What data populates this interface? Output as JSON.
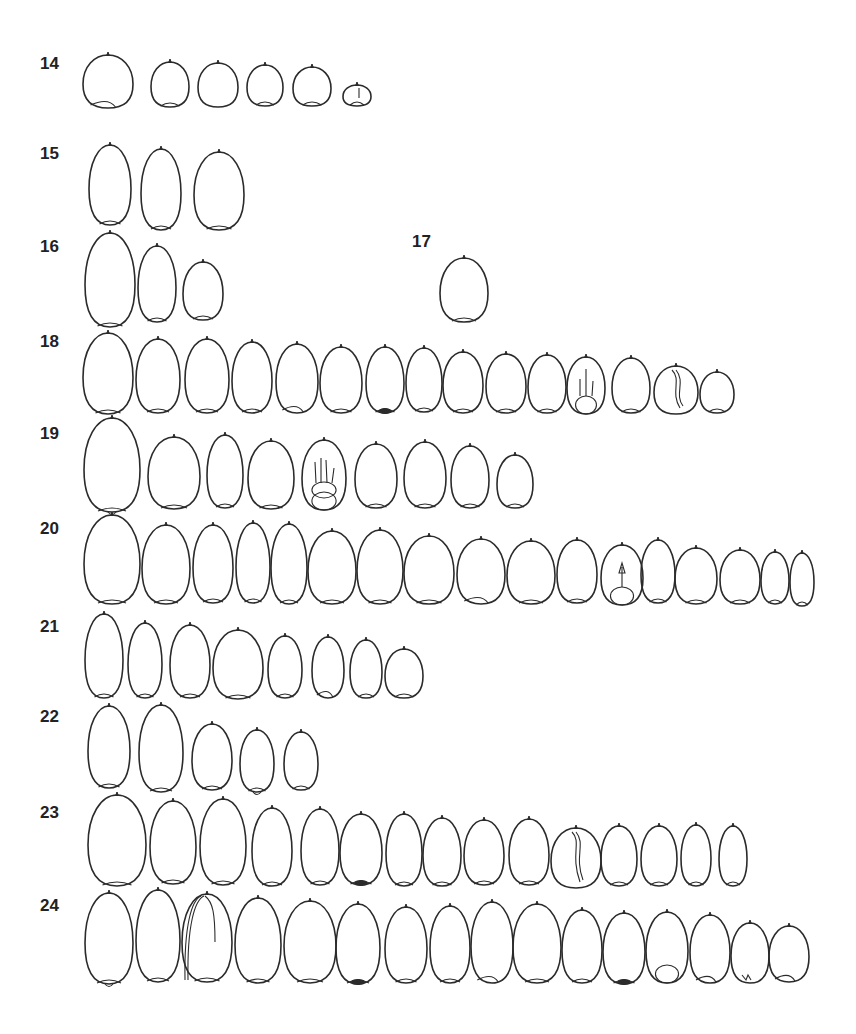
{
  "figure": {
    "type": "botanical seed outline plate",
    "line_color": "#2b2b2b",
    "label_color": "#222222",
    "background": "#ffffff"
  },
  "rows": [
    {
      "label": "14",
      "label_x": 40,
      "label_y": 55,
      "top": 55,
      "bottom": 108,
      "seeds": [
        {
          "cx": 108,
          "w": 50,
          "top": 55,
          "bottom": 108,
          "hilum": "offset"
        },
        {
          "cx": 170,
          "w": 38,
          "top": 62,
          "bottom": 107,
          "hilum": "bottom"
        },
        {
          "cx": 218,
          "w": 40,
          "top": 63,
          "bottom": 107,
          "hilum": "none"
        },
        {
          "cx": 265,
          "w": 36,
          "top": 65,
          "bottom": 106,
          "hilum": "bottom"
        },
        {
          "cx": 312,
          "w": 38,
          "top": 67,
          "bottom": 106,
          "hilum": "bottom"
        },
        {
          "cx": 357,
          "w": 28,
          "top": 85,
          "bottom": 106,
          "hilum": "bottom",
          "detail": "line"
        }
      ]
    },
    {
      "label": "15",
      "label_x": 40,
      "label_y": 145,
      "top": 145,
      "bottom": 203,
      "seeds": [
        {
          "cx": 110,
          "w": 42,
          "top": 145,
          "bottom": 225,
          "hilum": "bottom"
        },
        {
          "cx": 161,
          "w": 40,
          "top": 149,
          "bottom": 230,
          "hilum": "bottom"
        },
        {
          "cx": 219,
          "w": 50,
          "top": 152,
          "bottom": 230,
          "hilum": "bottom"
        }
      ]
    },
    {
      "label": "16",
      "label_x": 40,
      "label_y": 238,
      "top": 233,
      "bottom": 327,
      "seeds": [
        {
          "cx": 110,
          "w": 50,
          "top": 233,
          "bottom": 327,
          "hilum": "bottom"
        },
        {
          "cx": 157,
          "w": 38,
          "top": 246,
          "bottom": 322,
          "hilum": "bottom"
        },
        {
          "cx": 203,
          "w": 40,
          "top": 262,
          "bottom": 320,
          "hilum": "bottom"
        }
      ]
    },
    {
      "label": "17",
      "label_x": 412,
      "label_y": 233,
      "top": 258,
      "bottom": 322,
      "seeds": [
        {
          "cx": 464,
          "w": 48,
          "top": 258,
          "bottom": 322,
          "hilum": "bottom"
        }
      ]
    },
    {
      "label": "18",
      "label_x": 40,
      "label_y": 333,
      "top": 333,
      "bottom": 416,
      "seeds": [
        {
          "cx": 108,
          "w": 50,
          "top": 333,
          "bottom": 414,
          "hilum": "bottom"
        },
        {
          "cx": 158,
          "w": 44,
          "top": 339,
          "bottom": 413,
          "hilum": "bottom"
        },
        {
          "cx": 207,
          "w": 44,
          "top": 339,
          "bottom": 413,
          "hilum": "bottom"
        },
        {
          "cx": 252,
          "w": 40,
          "top": 342,
          "bottom": 413,
          "hilum": "bottom"
        },
        {
          "cx": 297,
          "w": 42,
          "top": 344,
          "bottom": 413,
          "hilum": "offset"
        },
        {
          "cx": 341,
          "w": 42,
          "top": 347,
          "bottom": 413,
          "hilum": "bottom"
        },
        {
          "cx": 385,
          "w": 38,
          "top": 347,
          "bottom": 413,
          "hilum": "dark"
        },
        {
          "cx": 424,
          "w": 36,
          "top": 348,
          "bottom": 412,
          "hilum": "bottom"
        },
        {
          "cx": 463,
          "w": 40,
          "top": 352,
          "bottom": 413,
          "hilum": "bottom"
        },
        {
          "cx": 506,
          "w": 40,
          "top": 354,
          "bottom": 413,
          "hilum": "bottom"
        },
        {
          "cx": 547,
          "w": 38,
          "top": 355,
          "bottom": 413,
          "hilum": "bottom"
        },
        {
          "cx": 586,
          "w": 38,
          "top": 357,
          "bottom": 414,
          "hilum": "embryo",
          "detail": "embryo"
        },
        {
          "cx": 631,
          "w": 38,
          "top": 358,
          "bottom": 413,
          "hilum": "bottom"
        },
        {
          "cx": 676,
          "w": 44,
          "top": 366,
          "bottom": 414,
          "hilum": "none",
          "detail": "fold"
        },
        {
          "cx": 717,
          "w": 34,
          "top": 372,
          "bottom": 413,
          "hilum": "bottom"
        }
      ]
    },
    {
      "label": "19",
      "label_x": 40,
      "label_y": 425,
      "top": 418,
      "bottom": 512,
      "seeds": [
        {
          "cx": 112,
          "w": 56,
          "top": 418,
          "bottom": 512,
          "hilum": "notch"
        },
        {
          "cx": 174,
          "w": 52,
          "top": 437,
          "bottom": 509,
          "hilum": "bottom"
        },
        {
          "cx": 225,
          "w": 36,
          "top": 435,
          "bottom": 508,
          "hilum": "bottom"
        },
        {
          "cx": 271,
          "w": 46,
          "top": 441,
          "bottom": 509,
          "hilum": "bottom"
        },
        {
          "cx": 324,
          "w": 44,
          "top": 440,
          "bottom": 510,
          "hilum": "embryo",
          "detail": "roots"
        },
        {
          "cx": 376,
          "w": 42,
          "top": 444,
          "bottom": 508,
          "hilum": "bottom"
        },
        {
          "cx": 425,
          "w": 42,
          "top": 442,
          "bottom": 508,
          "hilum": "bottom"
        },
        {
          "cx": 470,
          "w": 38,
          "top": 446,
          "bottom": 508,
          "hilum": "bottom"
        },
        {
          "cx": 515,
          "w": 36,
          "top": 455,
          "bottom": 508,
          "hilum": "bottom"
        }
      ]
    },
    {
      "label": "20",
      "label_x": 40,
      "label_y": 520,
      "top": 515,
      "bottom": 607,
      "seeds": [
        {
          "cx": 112,
          "w": 56,
          "top": 515,
          "bottom": 604,
          "hilum": "bottom"
        },
        {
          "cx": 166,
          "w": 48,
          "top": 525,
          "bottom": 604,
          "hilum": "bottom"
        },
        {
          "cx": 213,
          "w": 40,
          "top": 525,
          "bottom": 603,
          "hilum": "bottom"
        },
        {
          "cx": 253,
          "w": 34,
          "top": 523,
          "bottom": 603,
          "hilum": "bottom"
        },
        {
          "cx": 289,
          "w": 36,
          "top": 524,
          "bottom": 604,
          "hilum": "bottom"
        },
        {
          "cx": 332,
          "w": 48,
          "top": 531,
          "bottom": 604,
          "hilum": "bottom"
        },
        {
          "cx": 380,
          "w": 46,
          "top": 530,
          "bottom": 604,
          "hilum": "bottom"
        },
        {
          "cx": 429,
          "w": 50,
          "top": 536,
          "bottom": 604,
          "hilum": "bottom"
        },
        {
          "cx": 481,
          "w": 48,
          "top": 539,
          "bottom": 604,
          "hilum": "offset"
        },
        {
          "cx": 531,
          "w": 48,
          "top": 541,
          "bottom": 604,
          "hilum": "bottom"
        },
        {
          "cx": 577,
          "w": 40,
          "top": 540,
          "bottom": 603,
          "hilum": "bottom"
        },
        {
          "cx": 622,
          "w": 42,
          "top": 545,
          "bottom": 605,
          "hilum": "embryo",
          "detail": "shoot"
        },
        {
          "cx": 658,
          "w": 34,
          "top": 540,
          "bottom": 603,
          "hilum": "bottom"
        },
        {
          "cx": 696,
          "w": 42,
          "top": 548,
          "bottom": 604,
          "hilum": "bottom"
        },
        {
          "cx": 740,
          "w": 40,
          "top": 550,
          "bottom": 604,
          "hilum": "bottom"
        },
        {
          "cx": 775,
          "w": 28,
          "top": 552,
          "bottom": 604,
          "hilum": "bottom"
        },
        {
          "cx": 802,
          "w": 24,
          "top": 553,
          "bottom": 606,
          "hilum": "bottom"
        }
      ]
    },
    {
      "label": "21",
      "label_x": 40,
      "label_y": 618,
      "top": 612,
      "bottom": 698,
      "seeds": [
        {
          "cx": 104,
          "w": 38,
          "top": 614,
          "bottom": 698,
          "hilum": "bottom"
        },
        {
          "cx": 145,
          "w": 34,
          "top": 623,
          "bottom": 698,
          "hilum": "bottom"
        },
        {
          "cx": 190,
          "w": 40,
          "top": 625,
          "bottom": 698,
          "hilum": "bottom"
        },
        {
          "cx": 238,
          "w": 50,
          "top": 630,
          "bottom": 699,
          "hilum": "bottom"
        },
        {
          "cx": 285,
          "w": 34,
          "top": 636,
          "bottom": 698,
          "hilum": "bottom"
        },
        {
          "cx": 328,
          "w": 32,
          "top": 637,
          "bottom": 698,
          "hilum": "offset"
        },
        {
          "cx": 366,
          "w": 32,
          "top": 640,
          "bottom": 698,
          "hilum": "bottom"
        },
        {
          "cx": 404,
          "w": 38,
          "top": 649,
          "bottom": 698,
          "hilum": "bottom"
        }
      ]
    },
    {
      "label": "22",
      "label_x": 40,
      "label_y": 708,
      "top": 703,
      "bottom": 792,
      "seeds": [
        {
          "cx": 109,
          "w": 42,
          "top": 706,
          "bottom": 788,
          "hilum": "bottom"
        },
        {
          "cx": 161,
          "w": 44,
          "top": 705,
          "bottom": 792,
          "hilum": "bottom"
        },
        {
          "cx": 212,
          "w": 40,
          "top": 724,
          "bottom": 790,
          "hilum": "bottom"
        },
        {
          "cx": 257,
          "w": 34,
          "top": 730,
          "bottom": 792,
          "hilum": "notch"
        },
        {
          "cx": 301,
          "w": 34,
          "top": 732,
          "bottom": 790,
          "hilum": "bottom"
        }
      ]
    },
    {
      "label": "23",
      "label_x": 40,
      "label_y": 804,
      "top": 795,
      "bottom": 888,
      "seeds": [
        {
          "cx": 117,
          "w": 58,
          "top": 795,
          "bottom": 886,
          "hilum": "bottom"
        },
        {
          "cx": 173,
          "w": 46,
          "top": 801,
          "bottom": 884,
          "hilum": "bottom"
        },
        {
          "cx": 223,
          "w": 46,
          "top": 799,
          "bottom": 885,
          "hilum": "bottom"
        },
        {
          "cx": 272,
          "w": 40,
          "top": 808,
          "bottom": 886,
          "hilum": "bottom"
        },
        {
          "cx": 320,
          "w": 38,
          "top": 809,
          "bottom": 885,
          "hilum": "bottom"
        },
        {
          "cx": 361,
          "w": 42,
          "top": 814,
          "bottom": 885,
          "hilum": "dark"
        },
        {
          "cx": 404,
          "w": 36,
          "top": 814,
          "bottom": 886,
          "hilum": "bottom"
        },
        {
          "cx": 442,
          "w": 38,
          "top": 818,
          "bottom": 886,
          "hilum": "bottom"
        },
        {
          "cx": 484,
          "w": 40,
          "top": 820,
          "bottom": 885,
          "hilum": "bottom"
        },
        {
          "cx": 529,
          "w": 40,
          "top": 819,
          "bottom": 885,
          "hilum": "bottom"
        },
        {
          "cx": 576,
          "w": 50,
          "top": 828,
          "bottom": 888,
          "hilum": "none",
          "detail": "fold"
        },
        {
          "cx": 619,
          "w": 36,
          "top": 826,
          "bottom": 886,
          "hilum": "bottom"
        },
        {
          "cx": 659,
          "w": 36,
          "top": 826,
          "bottom": 886,
          "hilum": "bottom"
        },
        {
          "cx": 696,
          "w": 30,
          "top": 825,
          "bottom": 886,
          "hilum": "bottom"
        },
        {
          "cx": 733,
          "w": 28,
          "top": 826,
          "bottom": 886,
          "hilum": "bottom"
        }
      ]
    },
    {
      "label": "24",
      "label_x": 40,
      "label_y": 897,
      "top": 890,
      "bottom": 988,
      "seeds": [
        {
          "cx": 109,
          "w": 48,
          "top": 893,
          "bottom": 984,
          "hilum": "notch"
        },
        {
          "cx": 158,
          "w": 44,
          "top": 890,
          "bottom": 982,
          "hilum": "bottom"
        },
        {
          "cx": 207,
          "w": 50,
          "top": 894,
          "bottom": 982,
          "hilum": "bottom",
          "detail": "layered"
        },
        {
          "cx": 258,
          "w": 46,
          "top": 898,
          "bottom": 983,
          "hilum": "bottom"
        },
        {
          "cx": 310,
          "w": 52,
          "top": 901,
          "bottom": 983,
          "hilum": "bottom"
        },
        {
          "cx": 358,
          "w": 44,
          "top": 904,
          "bottom": 984,
          "hilum": "dark"
        },
        {
          "cx": 406,
          "w": 42,
          "top": 907,
          "bottom": 983,
          "hilum": "bottom"
        },
        {
          "cx": 450,
          "w": 40,
          "top": 906,
          "bottom": 983,
          "hilum": "bottom"
        },
        {
          "cx": 492,
          "w": 42,
          "top": 902,
          "bottom": 983,
          "hilum": "offset"
        },
        {
          "cx": 537,
          "w": 48,
          "top": 904,
          "bottom": 983,
          "hilum": "bottom"
        },
        {
          "cx": 582,
          "w": 40,
          "top": 910,
          "bottom": 983,
          "hilum": "bottom"
        },
        {
          "cx": 624,
          "w": 42,
          "top": 913,
          "bottom": 984,
          "hilum": "dark"
        },
        {
          "cx": 667,
          "w": 42,
          "top": 912,
          "bottom": 983,
          "hilum": "embryo"
        },
        {
          "cx": 710,
          "w": 40,
          "top": 915,
          "bottom": 983,
          "hilum": "offset"
        },
        {
          "cx": 750,
          "w": 38,
          "top": 923,
          "bottom": 983,
          "hilum": "none",
          "detail": "scratch"
        },
        {
          "cx": 789,
          "w": 40,
          "top": 926,
          "bottom": 982,
          "hilum": "offset"
        }
      ]
    }
  ]
}
